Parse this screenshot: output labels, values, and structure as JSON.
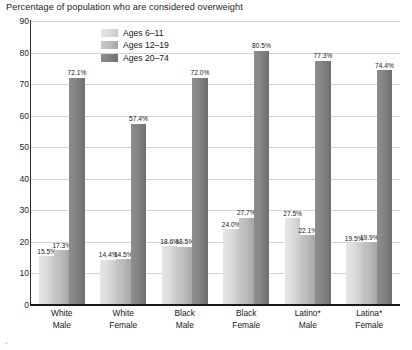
{
  "chart_data": {
    "type": "bar",
    "title": "Percentage of population who are considered overweight",
    "xlabel": "",
    "ylabel": "",
    "ylim": [
      0,
      90
    ],
    "ytick_step": 10,
    "yticks": [
      90,
      80,
      70,
      60,
      50,
      40,
      30,
      20,
      10,
      0
    ],
    "grid": true,
    "legend_position": "inside-top-center-left",
    "value_suffix": "%",
    "categories": [
      {
        "line1": "White",
        "line2": "Male"
      },
      {
        "line1": "White",
        "line2": "Female"
      },
      {
        "line1": "Black",
        "line2": "Male"
      },
      {
        "line1": "Black",
        "line2": "Female"
      },
      {
        "line1": "Latino*",
        "line2": "Male"
      },
      {
        "line1": "Latina*",
        "line2": "Female"
      }
    ],
    "series": [
      {
        "name": "Ages 6–11",
        "color": "#dddddd",
        "values": [
          15.5,
          14.4,
          18.6,
          24.0,
          27.5,
          19.5
        ],
        "labels": [
          "15.5%",
          "14.4%",
          "18.6%",
          "24.0%",
          "27.5%",
          "19.5%"
        ]
      },
      {
        "name": "Ages 12–19",
        "color": "#bdbdbd",
        "values": [
          17.3,
          14.5,
          18.5,
          27.7,
          22.1,
          19.9
        ],
        "labels": [
          "17.3%",
          "14.5%",
          "18.5%",
          "27.7%",
          "22.1%",
          "19.9%"
        ]
      },
      {
        "name": "Ages 20–74",
        "color": "#848484",
        "values": [
          72.1,
          57.4,
          72.0,
          80.5,
          77.3,
          74.4
        ],
        "labels": [
          "72.1%",
          "57.4%",
          "72.0%",
          "80.5%",
          "77.3%",
          "74.4%"
        ]
      }
    ]
  },
  "footnote": "*"
}
